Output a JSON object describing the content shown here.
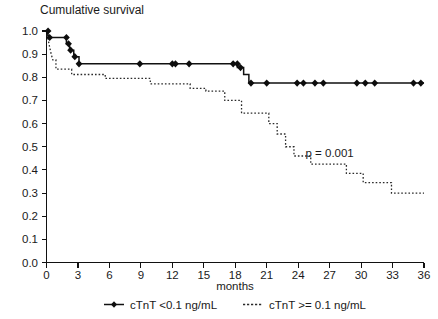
{
  "chart_data": {
    "type": "line",
    "title": "Cumulative survival",
    "subtitle": "",
    "xlabel": "months",
    "ylabel": "",
    "xlim": [
      0,
      36
    ],
    "ylim": [
      0.0,
      1.0
    ],
    "grid": false,
    "legend_position": "bottom",
    "xticks": [
      0,
      3,
      6,
      9,
      12,
      15,
      18,
      21,
      24,
      27,
      30,
      33,
      36
    ],
    "xticklabels": [
      "0",
      "3",
      "6",
      "9",
      "12",
      "15",
      "18",
      "21",
      "24",
      "27",
      "30",
      "33",
      "36"
    ],
    "yticks": [
      0.0,
      0.1,
      0.2,
      0.3,
      0.4,
      0.5,
      0.6,
      0.7,
      0.8,
      0.9,
      1.0
    ],
    "yticklabels": [
      "0.0",
      "0.1",
      "0.2",
      "0.3",
      "0.4",
      "0.5",
      "0.6",
      "0.7",
      "0.8",
      "0.9",
      "1.0"
    ],
    "annotations": [
      {
        "text": "p = 0.001",
        "x": 27.0,
        "y": 0.455
      }
    ],
    "series": [
      {
        "name": "cTnT <0.1 ng/mL",
        "style": "solid",
        "marker": "diamond",
        "points": [
          {
            "x": 0.0,
            "y": 1.0
          },
          {
            "x": 0.25,
            "y": 0.972
          },
          {
            "x": 1.9,
            "y": 0.972
          },
          {
            "x": 1.9,
            "y": 0.945
          },
          {
            "x": 2.2,
            "y": 0.945
          },
          {
            "x": 2.2,
            "y": 0.917
          },
          {
            "x": 2.6,
            "y": 0.917
          },
          {
            "x": 2.6,
            "y": 0.889
          },
          {
            "x": 3.1,
            "y": 0.889
          },
          {
            "x": 3.1,
            "y": 0.858
          },
          {
            "x": 12.0,
            "y": 0.858
          },
          {
            "x": 12.6,
            "y": 0.858
          },
          {
            "x": 18.2,
            "y": 0.858
          },
          {
            "x": 18.2,
            "y": 0.842
          },
          {
            "x": 18.8,
            "y": 0.842
          },
          {
            "x": 18.8,
            "y": 0.812
          },
          {
            "x": 19.3,
            "y": 0.812
          },
          {
            "x": 19.3,
            "y": 0.775
          },
          {
            "x": 36.0,
            "y": 0.775
          }
        ],
        "censor_points": [
          {
            "x": 0.15,
            "y": 1.0
          },
          {
            "x": 0.3,
            "y": 0.972
          },
          {
            "x": 1.9,
            "y": 0.972
          },
          {
            "x": 2.1,
            "y": 0.945
          },
          {
            "x": 2.3,
            "y": 0.917
          },
          {
            "x": 2.7,
            "y": 0.889
          },
          {
            "x": 3.1,
            "y": 0.858
          },
          {
            "x": 8.9,
            "y": 0.858
          },
          {
            "x": 12.0,
            "y": 0.858
          },
          {
            "x": 12.3,
            "y": 0.858
          },
          {
            "x": 13.6,
            "y": 0.858
          },
          {
            "x": 17.8,
            "y": 0.858
          },
          {
            "x": 18.2,
            "y": 0.858
          },
          {
            "x": 18.5,
            "y": 0.842
          },
          {
            "x": 19.5,
            "y": 0.775
          },
          {
            "x": 21.0,
            "y": 0.775
          },
          {
            "x": 23.9,
            "y": 0.775
          },
          {
            "x": 24.5,
            "y": 0.775
          },
          {
            "x": 25.6,
            "y": 0.775
          },
          {
            "x": 26.4,
            "y": 0.775
          },
          {
            "x": 29.6,
            "y": 0.775
          },
          {
            "x": 30.4,
            "y": 0.775
          },
          {
            "x": 31.3,
            "y": 0.775
          },
          {
            "x": 35.0,
            "y": 0.775
          },
          {
            "x": 35.7,
            "y": 0.775
          }
        ]
      },
      {
        "name": "cTnT >= 0.1 ng/mL",
        "style": "dotted",
        "marker": "none",
        "points": [
          {
            "x": 0.0,
            "y": 1.0
          },
          {
            "x": 0.15,
            "y": 0.965
          },
          {
            "x": 0.3,
            "y": 0.93
          },
          {
            "x": 0.45,
            "y": 0.9
          },
          {
            "x": 0.6,
            "y": 0.875
          },
          {
            "x": 0.9,
            "y": 0.875
          },
          {
            "x": 0.9,
            "y": 0.835
          },
          {
            "x": 2.4,
            "y": 0.835
          },
          {
            "x": 2.4,
            "y": 0.812
          },
          {
            "x": 5.6,
            "y": 0.812
          },
          {
            "x": 5.6,
            "y": 0.795
          },
          {
            "x": 9.9,
            "y": 0.795
          },
          {
            "x": 9.9,
            "y": 0.772
          },
          {
            "x": 13.7,
            "y": 0.772
          },
          {
            "x": 13.7,
            "y": 0.752
          },
          {
            "x": 15.2,
            "y": 0.752
          },
          {
            "x": 15.2,
            "y": 0.74
          },
          {
            "x": 17.0,
            "y": 0.74
          },
          {
            "x": 17.0,
            "y": 0.7
          },
          {
            "x": 18.6,
            "y": 0.7
          },
          {
            "x": 18.6,
            "y": 0.645
          },
          {
            "x": 21.2,
            "y": 0.645
          },
          {
            "x": 21.2,
            "y": 0.6
          },
          {
            "x": 22.0,
            "y": 0.6
          },
          {
            "x": 22.0,
            "y": 0.555
          },
          {
            "x": 22.8,
            "y": 0.555
          },
          {
            "x": 22.8,
            "y": 0.5
          },
          {
            "x": 23.6,
            "y": 0.5
          },
          {
            "x": 23.6,
            "y": 0.46
          },
          {
            "x": 25.2,
            "y": 0.46
          },
          {
            "x": 25.2,
            "y": 0.425
          },
          {
            "x": 28.6,
            "y": 0.425
          },
          {
            "x": 28.6,
            "y": 0.385
          },
          {
            "x": 30.2,
            "y": 0.385
          },
          {
            "x": 30.2,
            "y": 0.345
          },
          {
            "x": 32.9,
            "y": 0.345
          },
          {
            "x": 32.9,
            "y": 0.3
          },
          {
            "x": 36.0,
            "y": 0.3
          }
        ],
        "censor_points": []
      }
    ]
  },
  "legend": {
    "items": [
      {
        "label": "cTnT <0.1 ng/mL",
        "style": "solid"
      },
      {
        "label": "cTnT >= 0.1 ng/mL",
        "style": "dotted"
      }
    ]
  }
}
